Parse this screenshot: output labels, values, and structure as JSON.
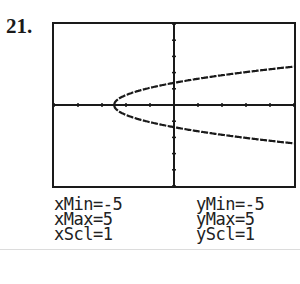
{
  "problem_number": "21.",
  "window": {
    "xmin_label": "xMin=-5",
    "xmax_label": "xMax=5",
    "xscl_label": "xScl=1",
    "ymin_label": "yMin=-5",
    "ymax_label": "yMax=5",
    "yscl_label": "yScl=1"
  },
  "chart_data": {
    "type": "line",
    "title": "",
    "xlabel": "",
    "ylabel": "",
    "xlim": [
      -5,
      5
    ],
    "ylim": [
      -5,
      5
    ],
    "xscl": 1,
    "yscl": 1,
    "grid": false,
    "axes": true,
    "series": [
      {
        "name": "upper branch",
        "x": [
          -2.5,
          -2,
          -1,
          0,
          1,
          2,
          3,
          4,
          5
        ],
        "y": [
          0,
          0.71,
          1.22,
          1.58,
          1.87,
          2.12,
          2.35,
          2.55,
          2.74
        ]
      },
      {
        "name": "lower branch",
        "x": [
          -2.5,
          -2,
          -1,
          0,
          1,
          2,
          3,
          4,
          5
        ],
        "y": [
          0,
          -0.71,
          -1.22,
          -1.58,
          -1.87,
          -2.12,
          -2.35,
          -2.55,
          -2.74
        ]
      }
    ]
  }
}
